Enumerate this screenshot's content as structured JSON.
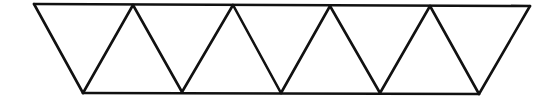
{
  "diagram": {
    "description": "Strip of nine equilateral triangles forming a parallelogram (alternating down/up triangles)",
    "stroke_color": "#111111",
    "background_color": "#ffffff",
    "triangle_count": 9,
    "top_vertices": [
      [
        34,
        4
      ],
      [
        133,
        5
      ],
      [
        233,
        5
      ],
      [
        330,
        6
      ],
      [
        430,
        6
      ],
      [
        530,
        6
      ]
    ],
    "bottom_vertices": [
      [
        83,
        93
      ],
      [
        182,
        92
      ],
      [
        281,
        93
      ],
      [
        380,
        93
      ],
      [
        479,
        94
      ]
    ]
  }
}
